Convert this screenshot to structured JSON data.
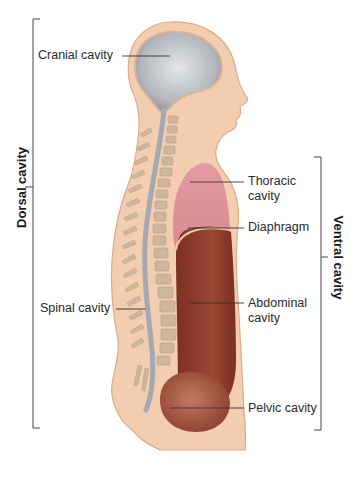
{
  "figure": {
    "colors": {
      "skin": "#f3cdb0",
      "skin_outline": "#e0a987",
      "cranial": "#b9bcc2",
      "spinal_cord": "#a9adb5",
      "vertebra": "#c9b49a",
      "thoracic": "#d98c8f",
      "abdominal": "#8e3b2c",
      "pelvic": "#a4553f",
      "leader_line": "#333333",
      "bracket": "#444444"
    },
    "labels": {
      "cranial": "Cranial cavity",
      "spinal": "Spinal cavity",
      "thoracic_line1": "Thoracic",
      "thoracic_line2": "cavity",
      "diaphragm": "Diaphragm",
      "abdominal_line1": "Abdominal",
      "abdominal_line2": "cavity",
      "pelvic": "Pelvic cavity"
    },
    "brackets": {
      "dorsal": "Dorsal cavity",
      "ventral": "Ventral cavity"
    }
  }
}
